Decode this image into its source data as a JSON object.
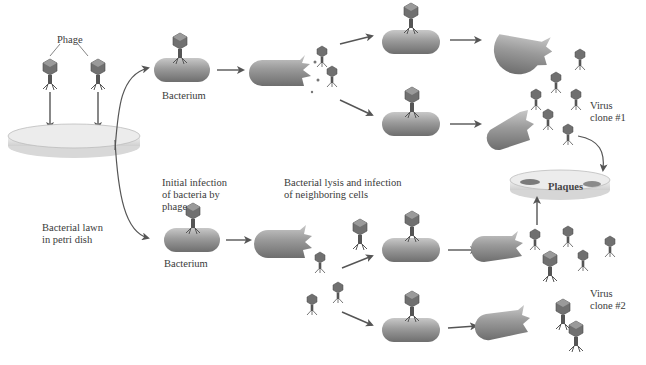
{
  "labels": {
    "phage": "Phage",
    "bacterial_lawn_line1": "Bacterial lawn",
    "bacterial_lawn_line2": "in petri dish",
    "bacterium_top": "Bacterium",
    "bacterium_bottom": "Bacterium",
    "initial_infection_line1": "Initial infection",
    "initial_infection_line2": "of bacteria by",
    "initial_infection_line3": "phage",
    "lysis_line1": "Bacterial lysis and infection",
    "lysis_line2": "of neighboring cells",
    "plaques": "Plaques",
    "virus_clone1_line1": "Virus",
    "virus_clone1_line2": "clone #1",
    "virus_clone2_line1": "Virus",
    "virus_clone2_line2": "clone #2"
  },
  "colors": {
    "bacterium": "#8c8c8c",
    "bacterium_highlight": "#c4c4c4",
    "arrow": "#555555",
    "dish": "#e4e4e4",
    "plaque": "#7a7a7a",
    "phage_head": "#6a6a6a"
  }
}
